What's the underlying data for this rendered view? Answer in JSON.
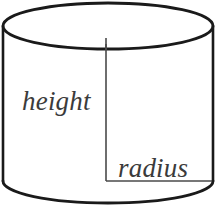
{
  "figure": {
    "name": "cylinder-diagram",
    "kind": "geometric-solid",
    "solid": "cylinder",
    "background_color": "#ffffff",
    "outline_color": "#1a1a1a",
    "measure_line_color": "#4a4a4a",
    "label_color": "#3b3b3b"
  },
  "labels": {
    "height": "height",
    "radius": "radius"
  },
  "geometry": {
    "top_ellipse": {
      "center_x": 108,
      "center_y": 26,
      "radius_x": 105,
      "radius_y": 23
    },
    "bottom_ellipse": {
      "center_x": 108,
      "center_y": 181,
      "radius_x": 105,
      "radius_y": 22
    },
    "left_wall_x": 3,
    "right_wall_x": 213,
    "height_line": {
      "x": 106,
      "y_top": 44,
      "y_bottom": 181
    },
    "radius_line": {
      "y": 181,
      "x_start": 106,
      "x_end": 212
    }
  }
}
